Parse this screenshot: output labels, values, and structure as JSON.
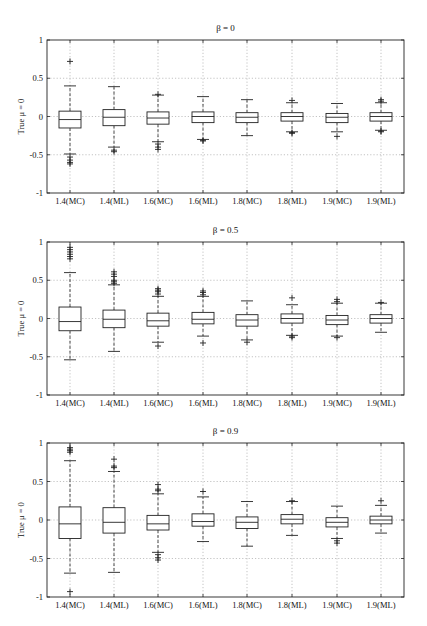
{
  "chart_data": [
    {
      "type": "box",
      "title": "β = 0",
      "xlabel": "",
      "ylabel": "True μ = 0",
      "ylim": [
        -1,
        1
      ],
      "yticks": [
        "1",
        "0.5",
        "0",
        "-0.5",
        "-1"
      ],
      "grid": true,
      "categories": [
        "1.4(MC)",
        "1.4(ML)",
        "1.6(MC)",
        "1.6(ML)",
        "1.8(MC)",
        "1.8(ML)",
        "1.9(MC)",
        "1.9(ML)"
      ],
      "boxes": [
        {
          "q1": -0.15,
          "median": -0.04,
          "q3": 0.07,
          "whisker_low": -0.49,
          "whisker_high": 0.4,
          "outliers": [
            0.72,
            -0.53,
            -0.57,
            -0.6,
            -0.62
          ]
        },
        {
          "q1": -0.12,
          "median": -0.01,
          "q3": 0.09,
          "whisker_low": -0.4,
          "whisker_high": 0.39,
          "outliers": [
            -0.44,
            -0.46
          ]
        },
        {
          "q1": -0.1,
          "median": -0.02,
          "q3": 0.06,
          "whisker_low": -0.33,
          "whisker_high": 0.28,
          "outliers": [
            0.29,
            -0.36,
            -0.4,
            -0.43
          ]
        },
        {
          "q1": -0.08,
          "median": 0.0,
          "q3": 0.06,
          "whisker_low": -0.3,
          "whisker_high": 0.26,
          "outliers": [
            -0.31,
            -0.32
          ]
        },
        {
          "q1": -0.08,
          "median": -0.01,
          "q3": 0.05,
          "whisker_low": -0.25,
          "whisker_high": 0.22,
          "outliers": []
        },
        {
          "q1": -0.06,
          "median": 0.0,
          "q3": 0.05,
          "whisker_low": -0.2,
          "whisker_high": 0.18,
          "outliers": [
            0.21,
            -0.21,
            -0.22
          ]
        },
        {
          "q1": -0.08,
          "median": -0.01,
          "q3": 0.04,
          "whisker_low": -0.2,
          "whisker_high": 0.17,
          "outliers": [
            -0.26
          ]
        },
        {
          "q1": -0.06,
          "median": 0.0,
          "q3": 0.05,
          "whisker_low": -0.18,
          "whisker_high": 0.18,
          "outliers": [
            0.2,
            0.22,
            -0.19,
            -0.2
          ]
        }
      ]
    },
    {
      "type": "box",
      "title": "β = 0.5",
      "xlabel": "",
      "ylabel": "True μ = 0",
      "ylim": [
        -1,
        1
      ],
      "yticks": [
        "1",
        "0.5",
        "0",
        "-0.5",
        "-1"
      ],
      "grid": true,
      "categories": [
        "1.4(MC)",
        "1.4(ML)",
        "1.6(MC)",
        "1.6(ML)",
        "1.8(MC)",
        "1.8(ML)",
        "1.9(MC)",
        "1.9(ML)"
      ],
      "boxes": [
        {
          "q1": -0.16,
          "median": -0.04,
          "q3": 0.15,
          "whisker_low": -0.54,
          "whisker_high": 0.6,
          "outliers": [
            0.78,
            0.81,
            0.84,
            0.87,
            0.9,
            0.93
          ]
        },
        {
          "q1": -0.12,
          "median": -0.01,
          "q3": 0.11,
          "whisker_low": -0.43,
          "whisker_high": 0.44,
          "outliers": [
            0.46,
            0.48,
            0.5,
            0.55,
            0.58,
            0.61
          ]
        },
        {
          "q1": -0.1,
          "median": -0.03,
          "q3": 0.07,
          "whisker_low": -0.31,
          "whisker_high": 0.29,
          "outliers": [
            0.32,
            0.35,
            0.37,
            0.39,
            -0.36
          ]
        },
        {
          "q1": -0.07,
          "median": -0.01,
          "q3": 0.08,
          "whisker_low": -0.23,
          "whisker_high": 0.29,
          "outliers": [
            0.31,
            0.34,
            0.36,
            -0.32
          ]
        },
        {
          "q1": -0.1,
          "median": -0.02,
          "q3": 0.05,
          "whisker_low": -0.28,
          "whisker_high": 0.23,
          "outliers": [
            -0.31
          ]
        },
        {
          "q1": -0.06,
          "median": 0.0,
          "q3": 0.06,
          "whisker_low": -0.22,
          "whisker_high": 0.18,
          "outliers": [
            0.27,
            -0.23,
            -0.25
          ]
        },
        {
          "q1": -0.08,
          "median": -0.02,
          "q3": 0.04,
          "whisker_low": -0.23,
          "whisker_high": 0.2,
          "outliers": [
            0.22,
            0.25,
            -0.25
          ]
        },
        {
          "q1": -0.06,
          "median": 0.0,
          "q3": 0.05,
          "whisker_low": -0.18,
          "whisker_high": 0.2,
          "outliers": [
            0.21
          ]
        }
      ]
    },
    {
      "type": "box",
      "title": "β = 0.9",
      "xlabel": "",
      "ylabel": "True μ = 0",
      "ylim": [
        -1,
        1
      ],
      "yticks": [
        "1",
        "0.5",
        "0",
        "-0.5",
        "-1"
      ],
      "grid": true,
      "categories": [
        "1.4(MC)",
        "1.4(ML)",
        "1.6(MC)",
        "1.6(ML)",
        "1.8(MC)",
        "1.8(ML)",
        "1.9(MC)",
        "1.9(ML)"
      ],
      "boxes": [
        {
          "q1": -0.24,
          "median": -0.05,
          "q3": 0.17,
          "whisker_low": -0.69,
          "whisker_high": 0.77,
          "outliers": [
            0.88,
            0.9,
            0.92,
            0.94,
            -0.93
          ]
        },
        {
          "q1": -0.17,
          "median": -0.03,
          "q3": 0.16,
          "whisker_low": -0.68,
          "whisker_high": 0.63,
          "outliers": [
            0.68,
            0.7,
            0.79
          ]
        },
        {
          "q1": -0.13,
          "median": -0.05,
          "q3": 0.06,
          "whisker_low": -0.42,
          "whisker_high": 0.34,
          "outliers": [
            0.38,
            0.4,
            0.46,
            -0.45,
            -0.49,
            -0.52
          ]
        },
        {
          "q1": -0.08,
          "median": -0.02,
          "q3": 0.08,
          "whisker_low": -0.28,
          "whisker_high": 0.3,
          "outliers": [
            0.37
          ]
        },
        {
          "q1": -0.11,
          "median": -0.03,
          "q3": 0.04,
          "whisker_low": -0.34,
          "whisker_high": 0.24,
          "outliers": []
        },
        {
          "q1": -0.05,
          "median": 0.01,
          "q3": 0.07,
          "whisker_low": -0.2,
          "whisker_high": 0.24,
          "outliers": [
            0.25
          ]
        },
        {
          "q1": -0.09,
          "median": -0.03,
          "q3": 0.03,
          "whisker_low": -0.24,
          "whisker_high": 0.18,
          "outliers": [
            -0.27,
            -0.3
          ]
        },
        {
          "q1": -0.05,
          "median": 0.0,
          "q3": 0.05,
          "whisker_low": -0.17,
          "whisker_high": 0.19,
          "outliers": [
            0.25
          ]
        }
      ]
    }
  ]
}
